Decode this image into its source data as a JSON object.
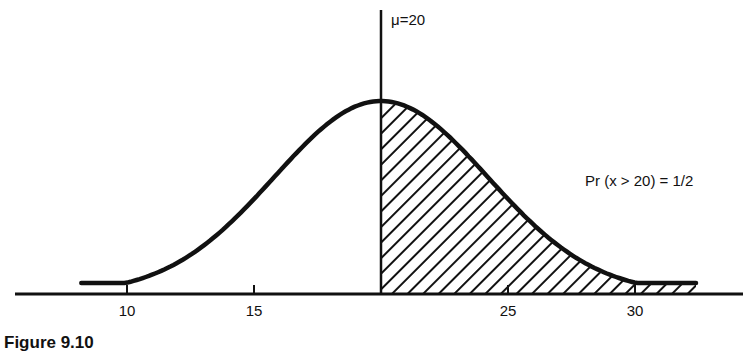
{
  "chart_data": {
    "type": "area",
    "xlabel": "",
    "ylabel": "",
    "x_ticks": [
      10,
      15,
      20,
      25,
      30
    ],
    "x_tick_labels": [
      "10",
      "15",
      "",
      "25",
      "30"
    ],
    "xlim": [
      8.3,
      34.5
    ],
    "mean": 20,
    "sd": 4.2,
    "curve_x_range": [
      8.2,
      32.4
    ],
    "shaded_region": {
      "from": 20,
      "to": 32.4,
      "pattern": "diagonal-hatch"
    },
    "grid": false,
    "legend": null,
    "annotations": [
      {
        "text": "μ=20",
        "x": 20,
        "position": "top of mean line"
      },
      {
        "text": "Pr (x > 20) = 1/2",
        "position": "right of curve, mid-height"
      }
    ]
  },
  "labels": {
    "mean_label": "μ=20",
    "prob_label": "Pr (x > 20) = 1/2",
    "tick_10": "10",
    "tick_15": "15",
    "tick_25": "25",
    "tick_30": "30",
    "caption": "Figure 9.10"
  },
  "colors": {
    "ink": "#111111",
    "background": "#ffffff"
  }
}
